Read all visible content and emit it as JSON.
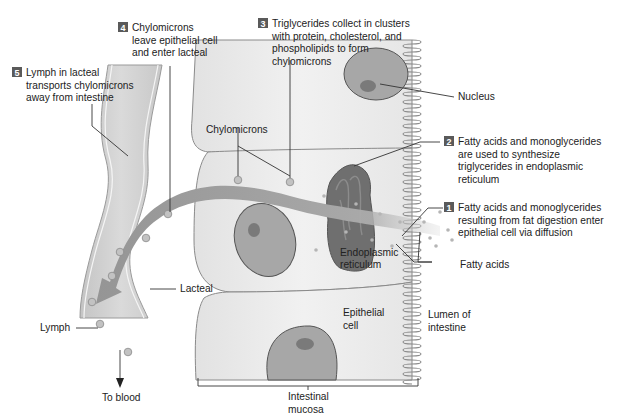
{
  "colors": {
    "cell_fill": "#ebebeb",
    "cell_stroke": "#8a8a8a",
    "nucleus_fill": "#a7a7a7",
    "nucleolus_fill": "#7a7a7a",
    "er_fill": "#6f6f6f",
    "arrow_fill": "#9c9c9c",
    "lacteal_fill": "#cfcfcf",
    "badge_fill": "#5a5a5a",
    "text": "#222222"
  },
  "steps": [
    {
      "number": "1",
      "lines": [
        "Fatty acids and monoglycerides",
        "resulting from fat digestion enter",
        "epithelial cell via diffusion"
      ]
    },
    {
      "number": "2",
      "lines": [
        "Fatty acids and monoglycerides",
        "are used to synthesize",
        "triglycerides in endoplasmic",
        "reticulum"
      ]
    },
    {
      "number": "3",
      "lines": [
        "Triglycerides collect in clusters",
        "with protein, cholesterol, and",
        "phospholipids to form",
        "chylomicrons"
      ]
    },
    {
      "number": "4",
      "lines": [
        "Chylomicrons",
        "leave epithelial cell",
        "and enter lacteal"
      ]
    },
    {
      "number": "5",
      "lines": [
        "Lymph in lacteal",
        "transports chylomicrons",
        "away from intestine"
      ]
    }
  ],
  "labels": {
    "nucleus": "Nucleus",
    "chylomicrons": "Chylomicrons",
    "er": [
      "Endoplasmic",
      "reticulum"
    ],
    "fatty_acids": "Fatty acids",
    "epithelial_cell": [
      "Epithelial",
      "cell"
    ],
    "lumen": [
      "Lumen of",
      "intestine"
    ],
    "lacteal": "Lacteal",
    "lymph": "Lymph",
    "to_blood": "To blood",
    "mucosa": [
      "Intestinal",
      "mucosa"
    ]
  }
}
